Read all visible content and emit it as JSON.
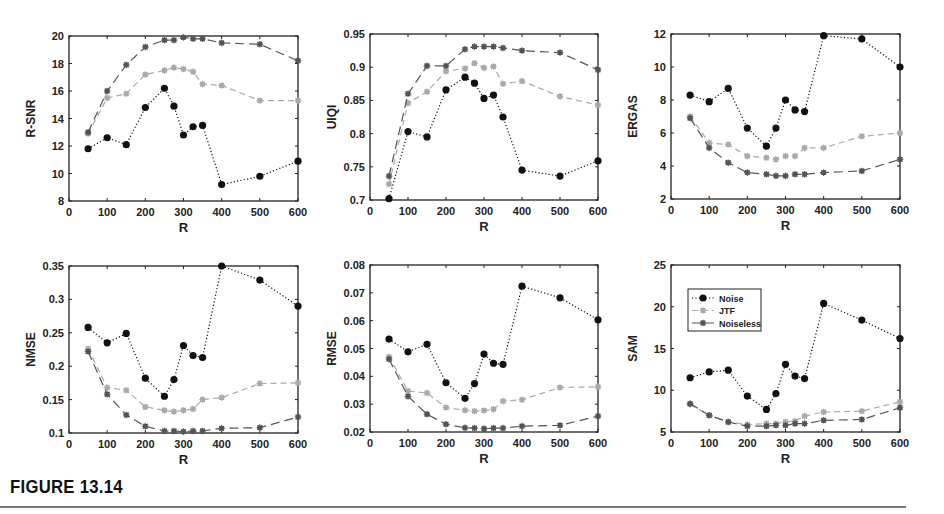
{
  "figure": {
    "caption": "FIGURE 13.14"
  },
  "legend": {
    "panel_index": 5,
    "entries": [
      {
        "name": "Noise",
        "style": "dotted",
        "color": "#111111",
        "marker": "circle-star"
      },
      {
        "name": "JTF",
        "style": "dashed",
        "color": "#aaaaaa",
        "marker": "star"
      },
      {
        "name": "Noiseless",
        "style": "long-dashed",
        "color": "#555555",
        "marker": "star"
      }
    ]
  },
  "chart_data": [
    {
      "type": "line",
      "title": "",
      "xlabel": "R",
      "ylabel": "R-SNR",
      "xlim": [
        0,
        600
      ],
      "ylim": [
        8,
        20
      ],
      "xticks": [
        0,
        100,
        200,
        300,
        400,
        500,
        600
      ],
      "yticks": [
        8,
        10,
        12,
        14,
        16,
        18,
        20
      ],
      "grid": false,
      "x": [
        50,
        100,
        150,
        200,
        250,
        275,
        300,
        325,
        350,
        400,
        500,
        600
      ],
      "series": [
        {
          "name": "Noise",
          "values": [
            11.8,
            12.6,
            12.1,
            14.8,
            16.2,
            14.9,
            12.8,
            13.4,
            13.5,
            9.2,
            9.8,
            10.9
          ]
        },
        {
          "name": "JTF",
          "values": [
            12.9,
            15.5,
            15.8,
            17.2,
            17.5,
            17.7,
            17.6,
            17.4,
            16.5,
            16.4,
            15.3,
            15.3
          ]
        },
        {
          "name": "Noiseless",
          "values": [
            13.0,
            16.0,
            17.9,
            19.2,
            19.7,
            19.7,
            19.9,
            19.8,
            19.8,
            19.5,
            19.4,
            18.2
          ]
        }
      ]
    },
    {
      "type": "line",
      "title": "",
      "xlabel": "R",
      "ylabel": "UIQI",
      "xlim": [
        0,
        600
      ],
      "ylim": [
        0.7,
        0.95
      ],
      "xticks": [
        0,
        100,
        200,
        300,
        400,
        500,
        600
      ],
      "yticks": [
        0.7,
        0.75,
        0.8,
        0.85,
        0.9,
        0.95
      ],
      "ytick_labels": [
        "0.7",
        "0.75",
        "0.8",
        "0.85",
        "0.9",
        "0.95"
      ],
      "grid": false,
      "x": [
        50,
        100,
        150,
        200,
        250,
        275,
        300,
        325,
        350,
        400,
        500,
        600
      ],
      "series": [
        {
          "name": "Noise",
          "values": [
            0.702,
            0.803,
            0.795,
            0.866,
            0.885,
            0.876,
            0.853,
            0.858,
            0.825,
            0.745,
            0.736,
            0.759
          ]
        },
        {
          "name": "JTF",
          "values": [
            0.724,
            0.846,
            0.863,
            0.894,
            0.898,
            0.906,
            0.899,
            0.901,
            0.875,
            0.879,
            0.856,
            0.843
          ]
        },
        {
          "name": "Noiseless",
          "values": [
            0.736,
            0.86,
            0.902,
            0.902,
            0.927,
            0.931,
            0.931,
            0.931,
            0.929,
            0.925,
            0.922,
            0.896
          ]
        }
      ]
    },
    {
      "type": "line",
      "title": "",
      "xlabel": "R",
      "ylabel": "ERGAS",
      "xlim": [
        0,
        600
      ],
      "ylim": [
        2,
        12
      ],
      "xticks": [
        0,
        100,
        200,
        300,
        400,
        500,
        600
      ],
      "yticks": [
        2,
        4,
        6,
        8,
        10,
        12
      ],
      "grid": false,
      "x": [
        50,
        100,
        150,
        200,
        250,
        275,
        300,
        325,
        350,
        400,
        500,
        600
      ],
      "series": [
        {
          "name": "Noise",
          "values": [
            8.3,
            7.9,
            8.7,
            6.3,
            5.2,
            6.3,
            8.0,
            7.4,
            7.3,
            11.9,
            11.7,
            10.0
          ]
        },
        {
          "name": "JTF",
          "values": [
            7.0,
            5.4,
            5.3,
            4.6,
            4.5,
            4.4,
            4.6,
            4.6,
            5.1,
            5.1,
            5.8,
            6.0
          ]
        },
        {
          "name": "Noiseless",
          "values": [
            6.9,
            5.1,
            4.2,
            3.6,
            3.5,
            3.4,
            3.4,
            3.5,
            3.5,
            3.6,
            3.7,
            4.4
          ]
        }
      ]
    },
    {
      "type": "line",
      "title": "",
      "xlabel": "R",
      "ylabel": "NMSE",
      "xlim": [
        0,
        600
      ],
      "ylim": [
        0.1,
        0.35
      ],
      "xticks": [
        0,
        100,
        200,
        300,
        400,
        500,
        600
      ],
      "yticks": [
        0.1,
        0.15,
        0.2,
        0.25,
        0.3,
        0.35
      ],
      "ytick_labels": [
        "0.1",
        "0.15",
        "0.2",
        "0.25",
        "0.3",
        "0.35"
      ],
      "grid": false,
      "x": [
        50,
        100,
        150,
        200,
        250,
        275,
        300,
        325,
        350,
        400,
        500,
        600
      ],
      "series": [
        {
          "name": "Noise",
          "values": [
            0.258,
            0.235,
            0.249,
            0.182,
            0.155,
            0.18,
            0.231,
            0.216,
            0.213,
            0.35,
            0.329,
            0.29
          ]
        },
        {
          "name": "JTF",
          "values": [
            0.226,
            0.168,
            0.164,
            0.139,
            0.134,
            0.132,
            0.134,
            0.136,
            0.15,
            0.153,
            0.174,
            0.175
          ]
        },
        {
          "name": "Noiseless",
          "values": [
            0.222,
            0.158,
            0.127,
            0.11,
            0.103,
            0.103,
            0.102,
            0.103,
            0.103,
            0.107,
            0.108,
            0.124
          ]
        }
      ]
    },
    {
      "type": "line",
      "title": "",
      "xlabel": "R",
      "ylabel": "RMSE",
      "xlim": [
        0,
        600
      ],
      "ylim": [
        0.02,
        0.08
      ],
      "xticks": [
        0,
        100,
        200,
        300,
        400,
        500,
        600
      ],
      "yticks": [
        0.02,
        0.03,
        0.04,
        0.05,
        0.06,
        0.07,
        0.08
      ],
      "ytick_labels": [
        "0.02",
        "0.03",
        "0.04",
        "0.05",
        "0.06",
        "0.07",
        "0.08"
      ],
      "grid": false,
      "x": [
        50,
        100,
        150,
        200,
        250,
        275,
        300,
        325,
        350,
        400,
        500,
        600
      ],
      "series": [
        {
          "name": "Noise",
          "values": [
            0.0534,
            0.0488,
            0.0515,
            0.0377,
            0.0321,
            0.0374,
            0.048,
            0.0447,
            0.0443,
            0.0724,
            0.0682,
            0.0603
          ]
        },
        {
          "name": "JTF",
          "values": [
            0.047,
            0.0347,
            0.034,
            0.0288,
            0.0278,
            0.0275,
            0.0277,
            0.0282,
            0.0311,
            0.0316,
            0.036,
            0.0362
          ]
        },
        {
          "name": "Noiseless",
          "values": [
            0.0462,
            0.0328,
            0.0264,
            0.0228,
            0.0215,
            0.0214,
            0.0212,
            0.0214,
            0.0214,
            0.0221,
            0.0224,
            0.0257
          ]
        }
      ]
    },
    {
      "type": "line",
      "title": "",
      "xlabel": "R",
      "ylabel": "SAM",
      "xlim": [
        0,
        600
      ],
      "ylim": [
        5,
        25
      ],
      "xticks": [
        0,
        100,
        200,
        300,
        400,
        500,
        600
      ],
      "yticks": [
        5,
        10,
        15,
        20,
        25
      ],
      "grid": false,
      "legend_position": "upper-left",
      "x": [
        50,
        100,
        150,
        200,
        250,
        275,
        300,
        325,
        350,
        400,
        500,
        600
      ],
      "series": [
        {
          "name": "Noise",
          "values": [
            11.5,
            12.2,
            12.4,
            9.3,
            7.7,
            9.6,
            13.1,
            11.7,
            11.4,
            20.4,
            18.4,
            16.2
          ]
        },
        {
          "name": "JTF",
          "values": [
            8.3,
            7.0,
            6.2,
            5.9,
            6.0,
            6.0,
            6.2,
            6.3,
            6.9,
            7.4,
            7.5,
            8.6
          ]
        },
        {
          "name": "Noiseless",
          "values": [
            8.4,
            7.0,
            6.2,
            5.7,
            5.7,
            5.8,
            5.8,
            6.0,
            6.0,
            6.4,
            6.5,
            7.9
          ]
        }
      ]
    }
  ],
  "layout": {
    "panels": [
      {
        "left": 69,
        "top": 36,
        "width": 229,
        "height": 165
      },
      {
        "left": 370,
        "top": 34,
        "width": 228,
        "height": 166
      },
      {
        "left": 671,
        "top": 34,
        "width": 229,
        "height": 165
      },
      {
        "left": 69,
        "top": 266,
        "width": 229,
        "height": 167
      },
      {
        "left": 370,
        "top": 265,
        "width": 228,
        "height": 167
      },
      {
        "left": 671,
        "top": 265,
        "width": 229,
        "height": 167
      }
    ]
  }
}
